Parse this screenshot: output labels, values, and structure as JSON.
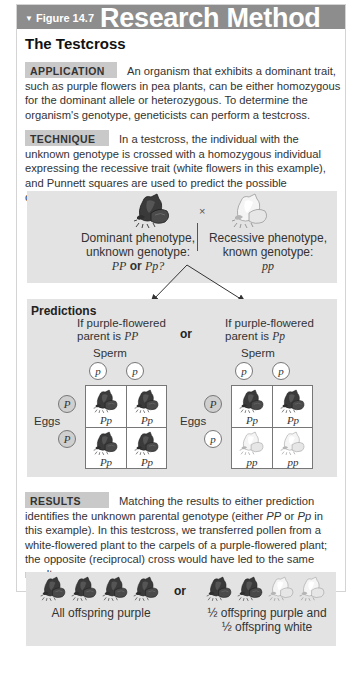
{
  "figure": {
    "label": "Figure 14.7",
    "category": "Research Method",
    "title": "The Testcross"
  },
  "application": {
    "tag": "APPLICATION",
    "text": "An organism that exhibits a dominant trait, such as purple flowers in pea plants, can be either homozygous for the dominant allele or heterozygous. To determine the organism's genotype, geneticists can perform a testcross."
  },
  "technique": {
    "tag": "TECHNIQUE",
    "text": "In a testcross, the individual with the unknown genotype is crossed with a homozygous individual expressing the recessive trait (white flowers in this example), and Punnett squares are used to predict the possible outcomes."
  },
  "cross": {
    "symbol": "×",
    "dominant": {
      "line1": "Dominant phenotype,",
      "line2": "unknown genotype:",
      "geno_a": "PP",
      "or": "or",
      "geno_b": "Pp?",
      "color": "#3e3e3e"
    },
    "recessive": {
      "line1": "Recessive phenotype,",
      "line2": "known genotype:",
      "geno": "pp",
      "color": "#e6e6e6"
    }
  },
  "predictions": {
    "heading": "Predictions",
    "or": "or",
    "left": {
      "line1": "If purple-flowered",
      "line2_prefix": "parent is ",
      "parent_geno": "PP",
      "sperm_label": "Sperm",
      "eggs_label": "Eggs",
      "sperm": [
        "p",
        "p"
      ],
      "eggs": [
        "P",
        "P"
      ],
      "cells": [
        {
          "geno": "Pp",
          "phenotype": "purple"
        },
        {
          "geno": "Pp",
          "phenotype": "purple"
        },
        {
          "geno": "Pp",
          "phenotype": "purple"
        },
        {
          "geno": "Pp",
          "phenotype": "purple"
        }
      ]
    },
    "right": {
      "line1": "If purple-flowered",
      "line2_prefix": "parent is ",
      "parent_geno": "Pp",
      "sperm_label": "Sperm",
      "eggs_label": "Eggs",
      "sperm": [
        "p",
        "p"
      ],
      "eggs": [
        "P",
        "p"
      ],
      "cells": [
        {
          "geno": "Pp",
          "phenotype": "purple"
        },
        {
          "geno": "Pp",
          "phenotype": "purple"
        },
        {
          "geno": "pp",
          "phenotype": "white"
        },
        {
          "geno": "pp",
          "phenotype": "white"
        }
      ]
    }
  },
  "results": {
    "tag": "RESULTS",
    "text_1": "Matching the results to either prediction identifies the unknown parental genotype (either ",
    "geno_a": "PP",
    "text_2": " or ",
    "geno_b": "Pp",
    "text_3": " in this example). In this testcross, we transferred pollen from a white-flowered plant to the carpels of a purple-flowered plant; the opposite (reciprocal) cross would have led to the same results."
  },
  "outcomes": {
    "or": "or",
    "left": {
      "caption": "All offspring purple",
      "flowers": [
        "purple",
        "purple",
        "purple",
        "purple"
      ]
    },
    "right": {
      "caption_line1": "½ offspring purple and",
      "caption_line2": "½ offspring white",
      "flowers": [
        "purple",
        "purple",
        "white",
        "white"
      ]
    }
  },
  "colors": {
    "header_bg": "#8d8d8d",
    "tag_bg": "#c9c9c9",
    "panel_bg": "#e3e3e3",
    "purple_flower": "#3e3e3e",
    "white_flower": "#ececec"
  }
}
